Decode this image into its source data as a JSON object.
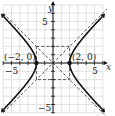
{
  "chart_data": {
    "type": "line",
    "title": "",
    "xlabel": "x",
    "ylabel": "y",
    "xlim": [
      -6,
      6
    ],
    "ylim": [
      -6,
      7
    ],
    "grid": true,
    "x_ticks_labeled": [
      "-5",
      "5"
    ],
    "y_ticks_labeled": [
      "5",
      "-5"
    ],
    "series": [
      {
        "name": "hyperbola",
        "equation": "x^2/4 - y^2/4 = 1",
        "style": "solid",
        "branches": [
          "left",
          "right"
        ],
        "arrows": true
      },
      {
        "name": "asymptote-1",
        "equation": "y = x",
        "style": "dashed"
      },
      {
        "name": "asymptote-2",
        "equation": "y = -x",
        "style": "dashed"
      },
      {
        "name": "fundamental-rectangle",
        "corners": [
          [
            -2,
            2
          ],
          [
            2,
            2
          ],
          [
            2,
            -2
          ],
          [
            -2,
            -2
          ]
        ],
        "style": "dashed"
      }
    ],
    "points": [
      {
        "x": -2,
        "y": 0,
        "label": "(−2, 0)"
      },
      {
        "x": 2,
        "y": 0,
        "label": "(2, 0)"
      }
    ]
  },
  "labels": {
    "x_axis": "x",
    "y_axis": "y",
    "x_tick_neg": "−5",
    "x_tick_pos": "5",
    "y_tick_pos": "5",
    "y_tick_neg": "−5",
    "vertex_left": "(−2, 0)",
    "vertex_right": "(2, 0)"
  }
}
